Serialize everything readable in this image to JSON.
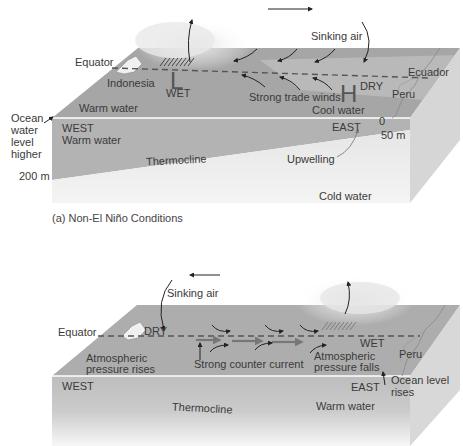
{
  "panel_a": {
    "caption": "(a) Non-El Niño Conditions",
    "labels": {
      "equator": "Equator",
      "indonesia": "Indonesia",
      "low": "L",
      "wet": "WET",
      "sinking_air": "Sinking air",
      "strong_trade_winds": "Strong trade winds",
      "high": "H",
      "dry": "DRY",
      "ecuador": "Ecuador",
      "peru": "Peru",
      "cool_water": "Cool water",
      "warm_water_surface": "Warm water",
      "ocean_level_1": "Ocean",
      "ocean_level_2": "water",
      "ocean_level_3": "level",
      "ocean_level_4": "higher",
      "west": "WEST",
      "warm_water_side": "Warm water",
      "east": "EAST",
      "depth_0": "0",
      "depth_50": "50 m",
      "thermocline": "Thermocline",
      "upwelling": "Upwelling",
      "depth_200": "200 m",
      "cold_water": "Cold water"
    }
  },
  "panel_b": {
    "labels": {
      "sinking_air": "Sinking air",
      "equator": "Equator",
      "dry": "DRY",
      "atm_rises_1": "Atmospheric",
      "atm_rises_2": "pressure rises",
      "strong_counter_current": "Strong counter current",
      "wet": "WET",
      "atm_falls_1": "Atmospheric",
      "atm_falls_2": "pressure falls",
      "peru": "Peru",
      "ocean_rises_1": "Ocean level",
      "ocean_rises_2": "rises",
      "west": "WEST",
      "east": "EAST",
      "thermocline": "Thermocline",
      "warm_water": "Warm water"
    }
  },
  "colors": {
    "surface": "#a8a8a8",
    "side_warm": "#b4b4b4",
    "cold": "#ececec",
    "end_face": "#d6d6d6",
    "text": "#3a3a3a"
  }
}
